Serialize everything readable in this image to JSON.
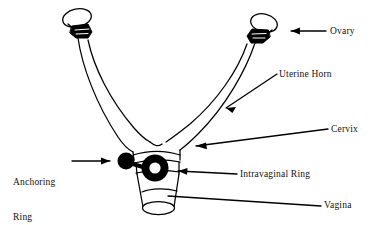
{
  "figure": {
    "background_color": "#ffffff",
    "ink_color": "#000000"
  },
  "labels": {
    "ovary": "Ovary",
    "uterine_horn": "Uterine Horn",
    "cervix": "Cervix",
    "intravaginal_ring": "Intravaginal Ring",
    "anchoring_ring_line1": "Anchoring",
    "anchoring_ring_line2": "Ring",
    "vagina": "Vagina"
  },
  "anatomy": {
    "parts": [
      {
        "name": "ovary-left",
        "shape": "oval-outline-with-dark-blob"
      },
      {
        "name": "ovary-right",
        "shape": "oval-outline-with-dark-blob"
      },
      {
        "name": "uterine-horn-left",
        "shape": "curved-tube"
      },
      {
        "name": "uterine-horn-right",
        "shape": "curved-tube"
      },
      {
        "name": "uterine-body-cervix",
        "shape": "banded-cylinder"
      },
      {
        "name": "vagina",
        "shape": "open-cylinder"
      }
    ],
    "devices": [
      {
        "name": "anchoring-ring",
        "shape": "solid-disc",
        "color": "#000000"
      },
      {
        "name": "connecting-stem",
        "shape": "short-bar",
        "color": "#000000"
      },
      {
        "name": "intravaginal-ring",
        "shape": "thick-annulus",
        "color": "#000000"
      }
    ]
  },
  "leaders": [
    {
      "name": "leader-ovary",
      "style": "arrow",
      "points_to": "ovary-right"
    },
    {
      "name": "leader-uterine-horn",
      "style": "arrow",
      "points_to": "uterine-horn-right"
    },
    {
      "name": "leader-cervix",
      "style": "arrow",
      "points_to": "uterine-body-cervix"
    },
    {
      "name": "leader-intravaginal-ring",
      "style": "arrow",
      "points_to": "intravaginal-ring"
    },
    {
      "name": "leader-anchoring-ring",
      "style": "arrow",
      "points_to": "anchoring-ring"
    },
    {
      "name": "leader-vagina",
      "style": "plain-line",
      "points_to": "vagina"
    }
  ]
}
